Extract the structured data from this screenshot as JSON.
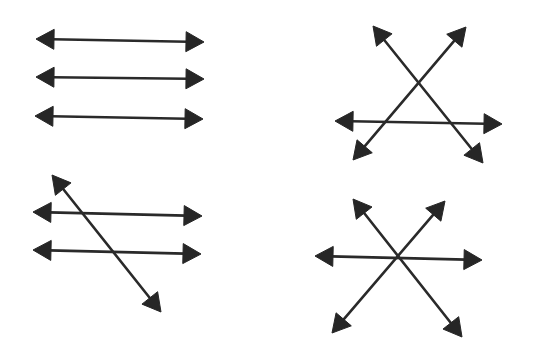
{
  "diagram": {
    "title": "",
    "colors": {
      "background": "#ffffff",
      "stroke": "#2a2a2a",
      "arrowhead": "#262626"
    },
    "arrowhead": {
      "length": 18,
      "width": 20
    },
    "figures": [
      {
        "id": "three-parallel-lines",
        "position": "top-left",
        "lines": [
          {
            "x1": 36,
            "y1": 39,
            "x2": 204,
            "y2": 42
          },
          {
            "x1": 36,
            "y1": 77,
            "x2": 204,
            "y2": 79
          },
          {
            "x1": 35,
            "y1": 116,
            "x2": 203,
            "y2": 119
          }
        ]
      },
      {
        "id": "three-lines-triangle",
        "position": "top-right",
        "lines": [
          {
            "x1": 373,
            "y1": 26,
            "x2": 483,
            "y2": 163
          },
          {
            "x1": 466,
            "y1": 27,
            "x2": 353,
            "y2": 160
          },
          {
            "x1": 335,
            "y1": 121,
            "x2": 502,
            "y2": 124
          }
        ]
      },
      {
        "id": "parallel-lines-with-transversal",
        "position": "bottom-left",
        "lines": [
          {
            "x1": 52,
            "y1": 175,
            "x2": 161,
            "y2": 312
          },
          {
            "x1": 33,
            "y1": 212,
            "x2": 202,
            "y2": 216
          },
          {
            "x1": 33,
            "y1": 250,
            "x2": 201,
            "y2": 254
          }
        ]
      },
      {
        "id": "three-concurrent-lines",
        "position": "bottom-right",
        "lines": [
          {
            "x1": 353,
            "y1": 199,
            "x2": 462,
            "y2": 337
          },
          {
            "x1": 445,
            "y1": 201,
            "x2": 332,
            "y2": 333
          },
          {
            "x1": 315,
            "y1": 256,
            "x2": 482,
            "y2": 260
          }
        ]
      }
    ]
  }
}
